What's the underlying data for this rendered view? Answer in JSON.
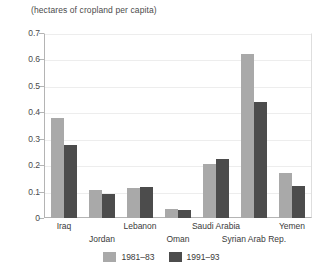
{
  "chart_data": {
    "type": "bar",
    "title": "",
    "subtitle": "",
    "axis_caption": "(hectares of cropland per capita)",
    "xlabel": "",
    "ylabel": "",
    "ylim": [
      0,
      0.7
    ],
    "grid": true,
    "legend_position": "bottom",
    "categories": [
      "Iraq",
      "Jordan",
      "Lebanon",
      "Oman",
      "Saudi Arabia",
      "Syrian Arab Rep.",
      "Yemen"
    ],
    "ytick_labels": [
      "0",
      "0.1",
      "0.2",
      "0.3",
      "0.4",
      "0.5",
      "0.6",
      "0.7"
    ],
    "ytick_values": [
      0,
      0.1,
      0.2,
      0.3,
      0.4,
      0.5,
      0.6,
      0.7
    ],
    "series": [
      {
        "name": "1981–83",
        "color": "#a9a9a9",
        "values": [
          0.38,
          0.105,
          0.115,
          0.035,
          0.205,
          0.62,
          0.17
        ]
      },
      {
        "name": "1991–93",
        "color": "#4c4c4c",
        "values": [
          0.275,
          0.09,
          0.118,
          0.032,
          0.225,
          0.44,
          0.12
        ]
      }
    ]
  },
  "legend": {
    "entries": [
      {
        "label": "1981–83",
        "color": "#a9a9a9"
      },
      {
        "label": "1991–93",
        "color": "#4c4c4c"
      }
    ]
  }
}
